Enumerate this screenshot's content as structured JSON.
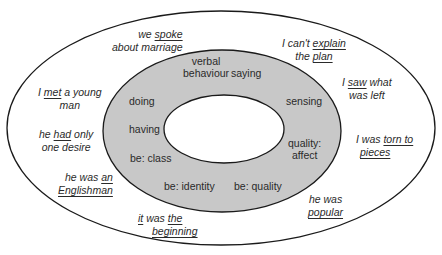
{
  "diagram": {
    "title": "",
    "colors": {
      "ring_fill": "#c8c8c8",
      "outline": "#1a1a1a",
      "background": "#ffffff"
    },
    "inner_ring_labels": [
      {
        "id": "verbal-behaviour",
        "lines": [
          "verbal",
          "behaviour"
        ]
      },
      {
        "id": "saying",
        "lines": [
          "saying"
        ]
      },
      {
        "id": "sensing",
        "lines": [
          "sensing"
        ]
      },
      {
        "id": "quality-affect",
        "lines": [
          "quality:",
          "affect"
        ]
      },
      {
        "id": "be-quality",
        "lines": [
          "be: quality"
        ]
      },
      {
        "id": "be-identity",
        "lines": [
          "be: identity"
        ]
      },
      {
        "id": "be-class",
        "lines": [
          "be: class"
        ]
      },
      {
        "id": "having",
        "lines": [
          "having"
        ]
      },
      {
        "id": "doing",
        "lines": [
          "doing"
        ]
      }
    ],
    "outer_examples": [
      {
        "id": "spoke",
        "l1": [
          "we ",
          "spoke",
          ""
        ],
        "l2": [
          "about marriage",
          "",
          ""
        ]
      },
      {
        "id": "explain",
        "l1": [
          "I can't ",
          "explain",
          ""
        ],
        "l2": [
          "the ",
          "plan",
          ""
        ]
      },
      {
        "id": "saw",
        "l1": [
          "I ",
          "saw",
          " what"
        ],
        "l2": [
          "was left",
          "",
          ""
        ]
      },
      {
        "id": "torn",
        "l1": [
          "I was ",
          "torn to",
          ""
        ],
        "l2": [
          "",
          "pieces",
          ""
        ]
      },
      {
        "id": "popular",
        "l1": [
          "he was",
          "",
          ""
        ],
        "l2": [
          "",
          "popular",
          ""
        ]
      },
      {
        "id": "beginning",
        "l1": [
          "",
          "it",
          " was "
        ],
        "l1b": "the",
        "l2": [
          "",
          "beginning",
          ""
        ]
      },
      {
        "id": "englishman",
        "l1": [
          "he was ",
          "an",
          ""
        ],
        "l2": [
          "",
          "Englishman",
          ""
        ]
      },
      {
        "id": "had",
        "l1": [
          "he ",
          "had",
          " only"
        ],
        "l2": [
          "one desire",
          "",
          ""
        ]
      },
      {
        "id": "met",
        "l1": [
          "I ",
          "met",
          " a young"
        ],
        "l2": [
          "man",
          "",
          ""
        ]
      }
    ]
  }
}
